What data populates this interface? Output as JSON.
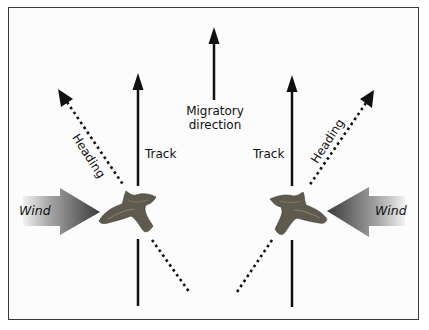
{
  "diagram": {
    "center": {
      "label_line1": "Migratory",
      "label_line2": "direction",
      "arrow": "migratory-direction-arrow"
    },
    "left_panel": {
      "track_label": "Track",
      "heading_label": "Heading",
      "wind_label": "Wind",
      "wind_direction": "left-to-right"
    },
    "right_panel": {
      "track_label": "Track",
      "heading_label": "Heading",
      "wind_label": "Wind",
      "wind_direction": "right-to-left"
    },
    "colors": {
      "frame": "#3a3a3a",
      "arrow": "#111111",
      "wind_dark": "#3c3c3c",
      "wind_light": "#e6e6e6",
      "bird": "#5f5a4e"
    }
  }
}
